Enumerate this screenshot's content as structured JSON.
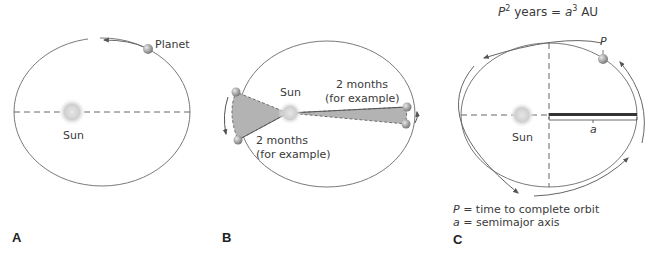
{
  "panels": [
    {
      "id": "A",
      "label": "A",
      "sun_label": "Sun",
      "planet_label": "Planet"
    },
    {
      "id": "B",
      "label": "B",
      "sun_label": "Sun",
      "area_label_left_line1": "2 months",
      "area_label_left_line2": "(for example)",
      "area_label_right_line1": "2 months",
      "area_label_right_line2": "(for example)"
    },
    {
      "id": "C",
      "label": "C",
      "sun_label": "Sun",
      "formula": {
        "P": "P",
        "exp_P": "2",
        "years": " years = ",
        "a": "a",
        "exp_a": "3",
        "AU": " AU"
      },
      "planet_label": "P",
      "axis_label": "a",
      "legend": [
        {
          "symbol": "P",
          "text": " = time to complete orbit"
        },
        {
          "symbol": "a",
          "text": " = semimajor axis"
        }
      ]
    }
  ],
  "colors": {
    "orbit": "#7a7a7a",
    "shade": "#b3b3b3",
    "sun": "#cfcfcf",
    "planet": "#9a9a9a"
  }
}
